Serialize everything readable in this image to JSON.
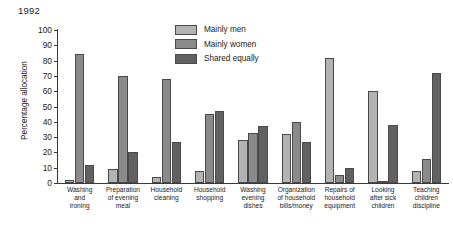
{
  "chart_data": {
    "type": "bar",
    "title": "1992",
    "xlabel": "",
    "ylabel": "Percentage allocation",
    "ylim": [
      0,
      100
    ],
    "ytick_step": 10,
    "yticks": [
      0,
      10,
      20,
      30,
      40,
      50,
      60,
      70,
      80,
      90,
      100
    ],
    "grid": false,
    "legend_position": "inside-top-center",
    "categories": [
      "Washing and ironing",
      "Preparation of evening meal",
      "Household cleaning",
      "Household shopping",
      "Washing evening dishes",
      "Organization of household bills/money",
      "Repairs of household equipment",
      "Looking after sick children",
      "Teaching children discipline"
    ],
    "category_lines": [
      [
        "Washing",
        "and",
        "ironing"
      ],
      [
        "Preparation",
        "of evening",
        "meal"
      ],
      [
        "Household",
        "cleaning"
      ],
      [
        "Household",
        "shopping"
      ],
      [
        "Washing",
        "evening",
        "dishes"
      ],
      [
        "Organization",
        "of household",
        "bills/money"
      ],
      [
        "Repairs of",
        "household",
        "equipment"
      ],
      [
        "Looking",
        "after sick",
        "children"
      ],
      [
        "Teaching",
        "children",
        "discipline"
      ]
    ],
    "series": [
      {
        "name": "Mainly men",
        "color": "#b3b3b3",
        "values": [
          2,
          9,
          4,
          8,
          28,
          32,
          82,
          60,
          8
        ]
      },
      {
        "name": "Mainly women",
        "color": "#8a8a8a",
        "values": [
          84,
          70,
          68,
          45,
          33,
          40,
          5,
          1,
          16
        ]
      },
      {
        "name": "Shared equally",
        "color": "#616161",
        "values": [
          12,
          20,
          27,
          47,
          37,
          27,
          10,
          38,
          72
        ]
      }
    ]
  }
}
